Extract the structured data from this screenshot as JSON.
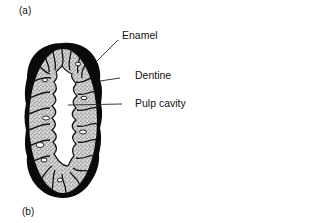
{
  "figure": {
    "panel_labels": {
      "top": "(a)",
      "bottom": "(b)"
    },
    "parts": [
      {
        "id": "enamel",
        "label": "Enamel"
      },
      {
        "id": "dentine",
        "label": "Dentine"
      },
      {
        "id": "pulp_cavity",
        "label": "Pulp cavity"
      }
    ]
  },
  "colors": {
    "enamel": "#0a0a0a",
    "dentine_fill": "#cfcfcf",
    "dentine_stipple": "#4a4a4a",
    "pulp": "#ffffff",
    "leader_line": "#222222",
    "text": "#111111"
  }
}
